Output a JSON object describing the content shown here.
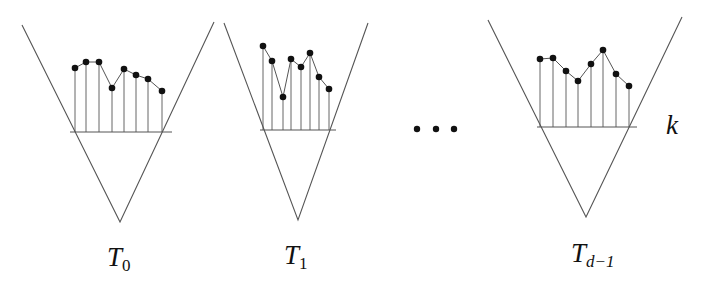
{
  "diagram": {
    "type": "tree-family-with-level-values",
    "colors": {
      "line": "#555555",
      "point": "#111111",
      "text": "#111111"
    },
    "trees": [
      {
        "label": {
          "main": "T",
          "sub": "0"
        },
        "v": {
          "left": [
            22,
            25
          ],
          "apex": [
            120,
            222
          ],
          "right": [
            214,
            22
          ]
        },
        "baseline": {
          "y": 132,
          "x1": 70,
          "x2": 172
        },
        "points": [
          [
            75,
            68
          ],
          [
            86,
            62
          ],
          [
            99,
            62
          ],
          [
            112,
            88
          ],
          [
            124,
            69
          ],
          [
            136,
            75
          ],
          [
            148,
            79
          ],
          [
            162,
            91
          ]
        ],
        "label_pos": [
          107,
          244
        ]
      },
      {
        "label": {
          "main": "T",
          "sub": "1"
        },
        "v": {
          "left": [
            224,
            23
          ],
          "apex": [
            298,
            220
          ],
          "right": [
            368,
            23
          ]
        },
        "baseline": {
          "y": 130,
          "x1": 260,
          "x2": 336
        },
        "points": [
          [
            263,
            46
          ],
          [
            272,
            61
          ],
          [
            283,
            97
          ],
          [
            291,
            59
          ],
          [
            301,
            67
          ],
          [
            310,
            53
          ],
          [
            319,
            77
          ],
          [
            329,
            89
          ]
        ],
        "label_pos": [
          284,
          242
        ]
      },
      {
        "label": {
          "main": "T",
          "sub": "d−1"
        },
        "v": {
          "left": [
            488,
            20
          ],
          "apex": [
            586,
            217
          ],
          "right": [
            682,
            17
          ]
        },
        "baseline": {
          "y": 127,
          "x1": 537,
          "x2": 637
        },
        "points": [
          [
            540,
            59
          ],
          [
            553,
            58
          ],
          [
            566,
            71
          ],
          [
            578,
            81
          ],
          [
            591,
            64
          ],
          [
            603,
            50
          ],
          [
            616,
            74
          ],
          [
            629,
            86
          ]
        ],
        "label_pos": [
          571,
          240
        ]
      }
    ],
    "ellipsis": {
      "text": "…",
      "dots": [
        [
          417,
          129
        ],
        [
          436,
          129
        ],
        [
          454,
          129
        ]
      ]
    },
    "level_label": {
      "text": "k",
      "pos": [
        666,
        112
      ]
    }
  }
}
